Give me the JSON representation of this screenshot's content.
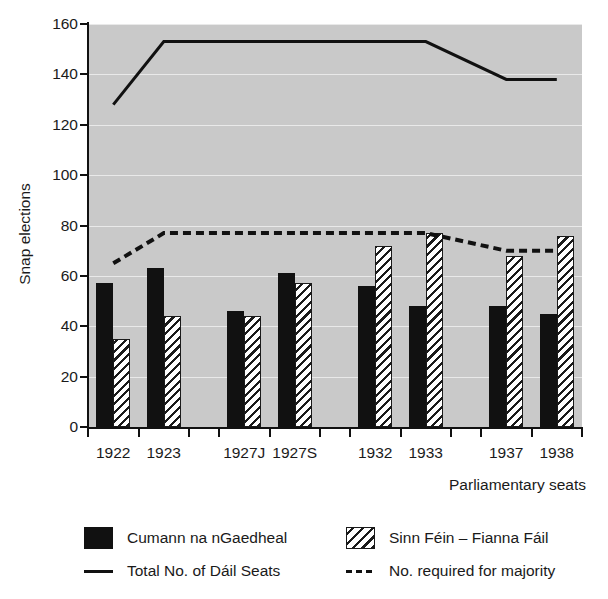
{
  "chart_data": {
    "type": "bar",
    "title": "",
    "xlabel": "Parliamentary seats",
    "ylabel": "Snap elections",
    "categories": [
      "1922",
      "1923",
      "1927J",
      "1927S",
      "1932",
      "1933",
      "1937",
      "1938"
    ],
    "ylim": [
      0,
      160
    ],
    "yticks": [
      0,
      20,
      40,
      60,
      80,
      100,
      120,
      140,
      160
    ],
    "grid": true,
    "legend_position": "bottom",
    "plot_background": "#c9c9c9",
    "series": [
      {
        "name": "Cumann na nGaedheal",
        "kind": "bar",
        "style": "solid-black",
        "color": "#111111",
        "values": [
          57,
          63,
          46,
          61,
          56,
          48,
          48,
          45
        ]
      },
      {
        "name": "Sinn Féin – Fianna Fáil",
        "kind": "bar",
        "style": "diagonal-hatch",
        "color": "#ffffff",
        "values": [
          35,
          44,
          44,
          57,
          72,
          77,
          68,
          76
        ]
      },
      {
        "name": "Total No. of Dáil Seats",
        "kind": "line",
        "style": "solid",
        "color": "#111111",
        "values": [
          128,
          153,
          153,
          153,
          153,
          153,
          138,
          138
        ]
      },
      {
        "name": "No. required for majority",
        "kind": "line",
        "style": "dashed",
        "color": "#111111",
        "values": [
          65,
          77,
          77,
          77,
          77,
          77,
          70,
          70
        ]
      }
    ]
  },
  "legend": {
    "items": [
      {
        "label": "Cumann na nGaedheal",
        "swatch": "solid"
      },
      {
        "label": "Sinn Féin – Fianna Fáil",
        "swatch": "hatch"
      },
      {
        "label": "Total No. of Dáil Seats",
        "swatch": "line-solid"
      },
      {
        "label": "No. required for majority",
        "swatch": "line-dashed"
      }
    ]
  }
}
